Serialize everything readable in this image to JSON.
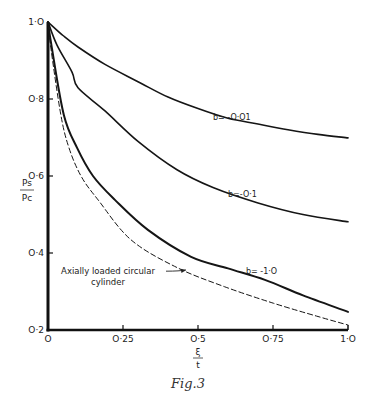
{
  "chart_data": {
    "type": "line",
    "title": "",
    "caption": "Fig.3",
    "xlabel": {
      "numerator": "ξ",
      "denominator": "t"
    },
    "ylabel": {
      "numerator": "Ps",
      "denominator": "Pc"
    },
    "xlim": [
      0,
      1.0
    ],
    "ylim": [
      0.2,
      1.0
    ],
    "grid": false,
    "x_ticks": [
      {
        "value": 0,
        "label": "O"
      },
      {
        "value": 0.25,
        "label": "O·25"
      },
      {
        "value": 0.5,
        "label": "O·5"
      },
      {
        "value": 0.75,
        "label": "O·75"
      },
      {
        "value": 1.0,
        "label": "1·O"
      }
    ],
    "y_ticks": [
      {
        "value": 0.2,
        "label": "O·2"
      },
      {
        "value": 0.4,
        "label": "O·4"
      },
      {
        "value": 0.6,
        "label": "O·6"
      },
      {
        "value": 0.8,
        "label": "O·8"
      },
      {
        "value": 1.0,
        "label": "1·O"
      }
    ],
    "series": [
      {
        "name": "b=-0·01",
        "label": "b= -O·O1",
        "style": "solid",
        "x": [
          0,
          0.05,
          0.1,
          0.19,
          0.3,
          0.4,
          0.5,
          0.6,
          0.7,
          0.8,
          0.9,
          1.0
        ],
        "y": [
          1.0,
          0.965,
          0.935,
          0.89,
          0.845,
          0.805,
          0.775,
          0.75,
          0.735,
          0.72,
          0.708,
          0.699
        ],
        "label_at": [
          0.55,
          0.745
        ]
      },
      {
        "name": "b=-0·1",
        "label": "b=-O·1",
        "style": "solid",
        "x": [
          0,
          0.03,
          0.08,
          0.1,
          0.19,
          0.3,
          0.43,
          0.55,
          0.7,
          0.85,
          1.0
        ],
        "y": [
          1.0,
          0.94,
          0.87,
          0.829,
          0.769,
          0.69,
          0.616,
          0.57,
          0.53,
          0.5,
          0.481
        ],
        "label_at": [
          0.6,
          0.545
        ]
      },
      {
        "name": "b=-1·0",
        "label": "b= -1·O",
        "style": "solid",
        "x": [
          0,
          0.013,
          0.053,
          0.097,
          0.15,
          0.223,
          0.333,
          0.477,
          0.6,
          0.723,
          0.85,
          1.0
        ],
        "y": [
          1.0,
          0.932,
          0.758,
          0.673,
          0.6,
          0.538,
          0.46,
          0.39,
          0.36,
          0.33,
          0.29,
          0.247
        ],
        "label_at": [
          0.66,
          0.345
        ]
      },
      {
        "name": "Axially loaded circular cylinder",
        "label": "",
        "style": "dashed",
        "x": [
          0,
          0.01,
          0.043,
          0.07,
          0.11,
          0.167,
          0.277,
          0.433,
          0.59,
          0.75,
          0.9,
          1.0
        ],
        "y": [
          1.0,
          0.93,
          0.758,
          0.673,
          0.6,
          0.538,
          0.434,
          0.361,
          0.312,
          0.27,
          0.235,
          0.213
        ]
      }
    ],
    "annotations": [
      {
        "text_line1": "Axially loaded circular",
        "text_line2": "cylinder",
        "text_at": [
          0.2,
          0.345
        ],
        "arrow_to": [
          0.46,
          0.356
        ],
        "target_series": "Axially loaded circular cylinder"
      }
    ]
  }
}
